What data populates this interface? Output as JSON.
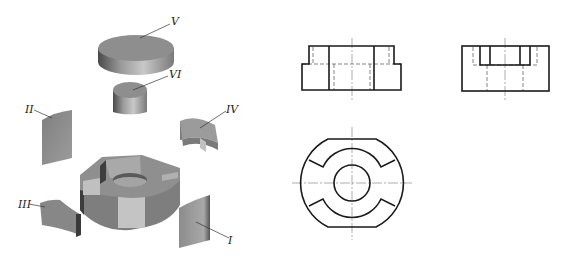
{
  "figure": {
    "type": "exploded-isometric-and-three-view-drawing",
    "parts": [
      {
        "id": "part-1",
        "label": "I"
      },
      {
        "id": "part-2",
        "label": "II"
      },
      {
        "id": "part-3",
        "label": "III"
      },
      {
        "id": "part-4",
        "label": "IV"
      },
      {
        "id": "part-5",
        "label": "V"
      },
      {
        "id": "part-6",
        "label": "VI"
      }
    ],
    "views": {
      "front": "front-view",
      "side": "side-view",
      "top": "top-view"
    },
    "colors": {
      "solid_gray": "#8a8a8a",
      "light_gray": "#bdbdbd",
      "dark_gray": "#5a5a5a",
      "line": "#1a1a1a"
    }
  }
}
